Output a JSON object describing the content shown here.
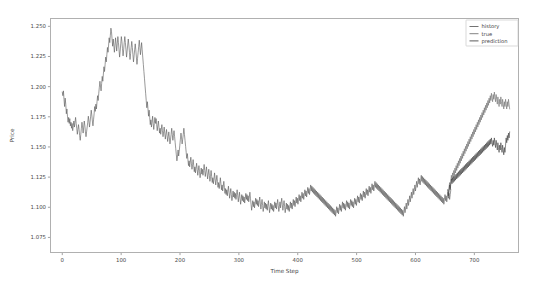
{
  "figure": {
    "background": "#ffffff",
    "width": 537,
    "height": 293
  },
  "chart_data": {
    "type": "line",
    "title": "",
    "xlabel": "Time Step",
    "ylabel": "Price",
    "xlim": [
      -20,
      775
    ],
    "ylim": [
      1.0625,
      1.2565
    ],
    "xticks": [
      0,
      100,
      200,
      300,
      400,
      500,
      600,
      700
    ],
    "xticklabels": [
      "0",
      "100",
      "200",
      "300",
      "400",
      "500",
      "600",
      "700"
    ],
    "yticks": [
      1.075,
      1.1,
      1.125,
      1.15,
      1.175,
      1.2,
      1.225,
      1.25
    ],
    "yticklabels": [
      "1.075",
      "1.100",
      "1.125",
      "1.150",
      "1.175",
      "1.200",
      "1.225",
      "1.250"
    ],
    "grid": false,
    "legend_position": "upper right",
    "legend_entries": [
      "history",
      "true",
      "prediction"
    ],
    "colors": {
      "history": "#5a5a5a",
      "true": "#6e6e6e",
      "prediction": "#3d3d3d",
      "axes_edge": "#b0b0b0",
      "tick_text": "#4a4a4a"
    },
    "series": [
      {
        "name": "history",
        "color": "#5a5a5a",
        "x_start": 0,
        "x_end": 660,
        "values": [
          1.1955,
          1.1925,
          1.1965,
          1.1895,
          1.1835,
          1.1905,
          1.1855,
          1.1775,
          1.1815,
          1.1755,
          1.1705,
          1.1745,
          1.1695,
          1.1735,
          1.1675,
          1.1705,
          1.1655,
          1.1695,
          1.1635,
          1.1675,
          1.1715,
          1.1665,
          1.1705,
          1.1745,
          1.1695,
          1.1655,
          1.1605,
          1.1645,
          1.1685,
          1.1645,
          1.1595,
          1.1555,
          1.1605,
          1.1655,
          1.1705,
          1.1665,
          1.1615,
          1.1665,
          1.1715,
          1.1675,
          1.1625,
          1.1585,
          1.1625,
          1.1665,
          1.1705,
          1.1755,
          1.1715,
          1.1665,
          1.1705,
          1.1755,
          1.1805,
          1.1765,
          1.1715,
          1.1675,
          1.1725,
          1.1775,
          1.1835,
          1.1795,
          1.1855,
          1.1815,
          1.1875,
          1.1925,
          1.1885,
          1.1945,
          1.1995,
          1.2045,
          1.2005,
          1.1965,
          1.2025,
          1.2085,
          1.2045,
          1.2105,
          1.2165,
          1.2125,
          1.2185,
          1.2245,
          1.2205,
          1.2265,
          1.2325,
          1.2285,
          1.2345,
          1.2405,
          1.2365,
          1.2425,
          1.2485,
          1.2455,
          1.2395,
          1.2335,
          1.2395,
          1.2345,
          1.2285,
          1.2345,
          1.2405,
          1.2355,
          1.2295,
          1.2355,
          1.2415,
          1.2365,
          1.2305,
          1.2245,
          1.2295,
          1.2355,
          1.2415,
          1.2375,
          1.2315,
          1.2255,
          1.2305,
          1.2365,
          1.2415,
          1.2365,
          1.2305,
          1.2245,
          1.2295,
          1.2345,
          1.2395,
          1.2345,
          1.2285,
          1.2225,
          1.2275,
          1.2325,
          1.2375,
          1.2325,
          1.2265,
          1.2205,
          1.2255,
          1.2305,
          1.2355,
          1.2305,
          1.2245,
          1.2185,
          1.2235,
          1.2285,
          1.2335,
          1.2385,
          1.2325,
          1.2265,
          1.2315,
          1.2365,
          1.2305,
          1.2245,
          1.2185,
          1.2125,
          1.2065,
          1.2005,
          1.1945,
          1.1885,
          1.1825,
          1.1875,
          1.1815,
          1.1755,
          1.1805,
          1.1745,
          1.1685,
          1.1725,
          1.1665,
          1.1705,
          1.1755,
          1.1695,
          1.1645,
          1.1695,
          1.1745,
          1.1695,
          1.1735,
          1.1685,
          1.1635,
          1.1675,
          1.1715,
          1.1665,
          1.1615,
          1.1655,
          1.1605,
          1.1645,
          1.1685,
          1.1635,
          1.1585,
          1.1625,
          1.1665,
          1.1615,
          1.1565,
          1.1605,
          1.1645,
          1.1595,
          1.1545,
          1.1585,
          1.1625,
          1.1575,
          1.1525,
          1.1565,
          1.1605,
          1.1655,
          1.1605,
          1.1555,
          1.1595,
          1.1635,
          1.1585,
          1.1535,
          1.1485,
          1.1435,
          1.1385,
          1.1425,
          1.1475,
          1.1425,
          1.1465,
          1.1515,
          1.1565,
          1.1615,
          1.1575,
          1.1525,
          1.1565,
          1.1605,
          1.1655,
          1.1605,
          1.1555,
          1.1505,
          1.1455,
          1.1405,
          1.1445,
          1.1395,
          1.1345,
          1.1385,
          1.1335,
          1.1375,
          1.1415,
          1.1365,
          1.1315,
          1.1355,
          1.1395,
          1.1345,
          1.1295,
          1.1335,
          1.1285,
          1.1325,
          1.1365,
          1.1315,
          1.1265,
          1.1305,
          1.1345,
          1.1295,
          1.1245,
          1.1285,
          1.1325,
          1.1275,
          1.1315,
          1.1265,
          1.1305,
          1.1355,
          1.1305,
          1.1255,
          1.1295,
          1.1335,
          1.1285,
          1.1235,
          1.1275,
          1.1315,
          1.1265,
          1.1215,
          1.1255,
          1.1305,
          1.1255,
          1.1205,
          1.1245,
          1.1195,
          1.1235,
          1.1285,
          1.1235,
          1.1185,
          1.1225,
          1.1265,
          1.1215,
          1.1165,
          1.1205,
          1.1155,
          1.1195,
          1.1245,
          1.1195,
          1.1145,
          1.1185,
          1.1135,
          1.1175,
          1.1215,
          1.1165,
          1.1115,
          1.1155,
          1.1105,
          1.1145,
          1.1095,
          1.1135,
          1.1175,
          1.1125,
          1.1075,
          1.1115,
          1.1155,
          1.1105,
          1.1055,
          1.1095,
          1.1135,
          1.1085,
          1.1125,
          1.1075,
          1.1115,
          1.1065,
          1.1105,
          1.1145,
          1.1095,
          1.1045,
          1.1085,
          1.1125,
          1.1075,
          1.1025,
          1.1065,
          1.1105,
          1.1055,
          1.1095,
          1.1045,
          1.1085,
          1.1035,
          1.1075,
          1.1115,
          1.1065,
          1.1105,
          1.1055,
          1.1095,
          1.1045,
          1.1085,
          1.1125,
          1.1075,
          1.1025,
          1.0975,
          1.1015,
          1.1055,
          1.1005,
          1.1045,
          1.0995,
          1.1035,
          1.1075,
          1.1025,
          1.1065,
          1.1015,
          1.1055,
          1.1005,
          1.1045,
          1.1085,
          1.1035,
          1.0985,
          1.1025,
          1.1065,
          1.1015,
          1.0965,
          1.1005,
          1.1045,
          1.0995,
          1.1035,
          1.0985,
          1.1025,
          1.0975,
          1.1015,
          1.1055,
          1.1005,
          1.0955,
          1.0995,
          1.1035,
          1.0985,
          1.1025,
          1.0975,
          1.1015,
          1.0965,
          1.1005,
          1.1045,
          1.0995,
          1.1035,
          1.0985,
          1.1025,
          1.1065,
          1.1015,
          1.0965,
          1.1005,
          1.1045,
          1.0995,
          1.1035,
          1.1075,
          1.1025,
          1.0975,
          1.1015,
          1.1055,
          1.1005,
          1.0955,
          1.0995,
          1.1035,
          1.0985,
          1.1025,
          1.0975,
          1.1015,
          1.0965,
          1.1005,
          1.1045,
          1.0995,
          1.1035,
          1.0985,
          1.1025,
          1.1065,
          1.1015,
          1.1055,
          1.1005,
          1.1045,
          1.1085,
          1.1035,
          1.1075,
          1.1025,
          1.1065,
          1.1105,
          1.1055,
          1.1095,
          1.1045,
          1.1085,
          1.1125,
          1.1075,
          1.1115,
          1.1065,
          1.1105,
          1.1145,
          1.1095,
          1.1135,
          1.1085,
          1.1125,
          1.1165,
          1.1115,
          1.1155,
          1.1105,
          1.1145,
          1.1185,
          1.1135,
          1.1175,
          1.1125,
          1.1165,
          1.1115,
          1.1155,
          1.1105,
          1.1145,
          1.1095,
          1.1135,
          1.1085,
          1.1125,
          1.1075,
          1.1115,
          1.1065,
          1.1105,
          1.1055,
          1.1095,
          1.1045,
          1.1085,
          1.1035,
          1.1075,
          1.1025,
          1.1065,
          1.1015,
          1.1055,
          1.1005,
          1.1045,
          1.0995,
          1.1035,
          1.0985,
          1.1025,
          1.0975,
          1.1015,
          1.0965,
          1.1005,
          1.0955,
          1.0995,
          1.0945,
          1.0985,
          1.0935,
          1.0975,
          1.0925,
          1.0965,
          1.1005,
          1.0955,
          1.0995,
          1.0945,
          1.0985,
          1.1025,
          1.0975,
          1.1015,
          1.0965,
          1.1005,
          1.1045,
          1.0995,
          1.1035,
          1.0985,
          1.1025,
          1.0975,
          1.1015,
          1.1055,
          1.1005,
          1.1045,
          1.0995,
          1.1035,
          1.0985,
          1.1025,
          1.1065,
          1.1015,
          1.1055,
          1.1005,
          1.1045,
          1.0995,
          1.1035,
          1.1075,
          1.1025,
          1.1065,
          1.1015,
          1.1055,
          1.1095,
          1.1045,
          1.1085,
          1.1035,
          1.1075,
          1.1115,
          1.1065,
          1.1105,
          1.1055,
          1.1095,
          1.1135,
          1.1085,
          1.1125,
          1.1075,
          1.1115,
          1.1155,
          1.1105,
          1.1145,
          1.1095,
          1.1135,
          1.1175,
          1.1125,
          1.1165,
          1.1115,
          1.1155,
          1.1195,
          1.1145,
          1.1185,
          1.1135,
          1.1175,
          1.1215,
          1.1165,
          1.1205,
          1.1155,
          1.1195,
          1.1145,
          1.1185,
          1.1135,
          1.1175,
          1.1125,
          1.1165,
          1.1115,
          1.1155,
          1.1105,
          1.1145,
          1.1095,
          1.1135,
          1.1085,
          1.1125,
          1.1075,
          1.1115,
          1.1065,
          1.1105,
          1.1055,
          1.1095,
          1.1045,
          1.1085,
          1.1035,
          1.1075,
          1.1025,
          1.1065,
          1.1015,
          1.1055,
          1.1005,
          1.1045,
          1.0995,
          1.1035,
          1.0985,
          1.1025,
          1.0975,
          1.1015,
          1.0965,
          1.1005,
          1.0955,
          1.0995,
          1.0945,
          1.0985,
          1.0935,
          1.0975,
          1.0925,
          1.0965,
          1.1005,
          1.0955,
          1.0995,
          1.1035,
          1.0985,
          1.1025,
          1.1065,
          1.1015,
          1.1055,
          1.1095,
          1.1045,
          1.1085,
          1.1125,
          1.1075,
          1.1115,
          1.1155,
          1.1105,
          1.1145,
          1.1185,
          1.1135,
          1.1175,
          1.1215,
          1.1165,
          1.1205,
          1.1245,
          1.1195,
          1.1235,
          1.1185,
          1.1225,
          1.1265,
          1.1215,
          1.1255,
          1.1205,
          1.1245,
          1.1195,
          1.1235,
          1.1185,
          1.1225,
          1.1175,
          1.1215,
          1.1165,
          1.1205,
          1.1155,
          1.1195,
          1.1145,
          1.1185,
          1.1135,
          1.1175,
          1.1125,
          1.1165,
          1.1115,
          1.1155,
          1.1105,
          1.1145,
          1.1095,
          1.1135,
          1.1085,
          1.1125,
          1.1075,
          1.1115,
          1.1065,
          1.1105,
          1.1055,
          1.1095,
          1.1045,
          1.1085,
          1.1035,
          1.1075,
          1.1025,
          1.1065,
          1.1105,
          1.1055,
          1.1095,
          1.1045,
          1.1085,
          1.1125,
          1.1075,
          1.1115,
          1.1065,
          1.1105,
          1.1145
        ]
      },
      {
        "name": "true",
        "color": "#6e6e6e",
        "x_start": 655,
        "x_end": 760,
        "values": [
          1.1145,
          1.1105,
          1.1165,
          1.1205,
          1.1155,
          1.1215,
          1.1265,
          1.1225,
          1.1285,
          1.1245,
          1.1305,
          1.1265,
          1.1325,
          1.1285,
          1.1345,
          1.1305,
          1.1365,
          1.1325,
          1.1385,
          1.1345,
          1.1405,
          1.1365,
          1.1425,
          1.1385,
          1.1445,
          1.1405,
          1.1465,
          1.1425,
          1.1485,
          1.1445,
          1.1505,
          1.1465,
          1.1525,
          1.1485,
          1.1545,
          1.1505,
          1.1565,
          1.1525,
          1.1585,
          1.1545,
          1.1605,
          1.1565,
          1.1625,
          1.1585,
          1.1645,
          1.1605,
          1.1665,
          1.1625,
          1.1685,
          1.1645,
          1.1705,
          1.1665,
          1.1725,
          1.1685,
          1.1745,
          1.1705,
          1.1765,
          1.1725,
          1.1785,
          1.1745,
          1.1805,
          1.1765,
          1.1825,
          1.1785,
          1.1845,
          1.1805,
          1.1865,
          1.1825,
          1.1885,
          1.1845,
          1.1905,
          1.1865,
          1.1925,
          1.1885,
          1.1945,
          1.1905,
          1.1875,
          1.1935,
          1.1895,
          1.1955,
          1.1915,
          1.1875,
          1.1935,
          1.1895,
          1.1855,
          1.1915,
          1.1875,
          1.1835,
          1.1895,
          1.1855,
          1.1915,
          1.1875,
          1.1835,
          1.1895,
          1.1855,
          1.1815,
          1.1875,
          1.1835,
          1.1895,
          1.1855,
          1.1815,
          1.1875,
          1.1835,
          1.1895,
          1.1855,
          1.1815
        ]
      },
      {
        "name": "prediction",
        "color": "#3d3d3d",
        "x_start": 655,
        "x_end": 760,
        "values": [
          1.1145,
          1.1095,
          1.1135,
          1.1185,
          1.1145,
          1.1195,
          1.1235,
          1.1195,
          1.1245,
          1.1205,
          1.1255,
          1.1215,
          1.1265,
          1.1225,
          1.1275,
          1.1235,
          1.1285,
          1.1245,
          1.1295,
          1.1255,
          1.1305,
          1.1265,
          1.1315,
          1.1275,
          1.1325,
          1.1285,
          1.1335,
          1.1295,
          1.1345,
          1.1305,
          1.1355,
          1.1315,
          1.1365,
          1.1325,
          1.1375,
          1.1335,
          1.1385,
          1.1345,
          1.1395,
          1.1355,
          1.1405,
          1.1365,
          1.1415,
          1.1375,
          1.1425,
          1.1385,
          1.1435,
          1.1395,
          1.1445,
          1.1405,
          1.1455,
          1.1415,
          1.1465,
          1.1425,
          1.1475,
          1.1435,
          1.1485,
          1.1445,
          1.1495,
          1.1455,
          1.1505,
          1.1465,
          1.1515,
          1.1475,
          1.1525,
          1.1485,
          1.1535,
          1.1495,
          1.1545,
          1.1505,
          1.1555,
          1.1515,
          1.1565,
          1.1525,
          1.1575,
          1.1535,
          1.1505,
          1.1555,
          1.1515,
          1.1575,
          1.1535,
          1.1495,
          1.1555,
          1.1515,
          1.1475,
          1.1535,
          1.1495,
          1.1455,
          1.1515,
          1.1475,
          1.1535,
          1.1495,
          1.1455,
          1.1515,
          1.1475,
          1.1435,
          1.1495,
          1.1455,
          1.1515,
          1.1575,
          1.1535,
          1.1595,
          1.1555,
          1.1615,
          1.1575,
          1.1625
        ]
      }
    ]
  }
}
